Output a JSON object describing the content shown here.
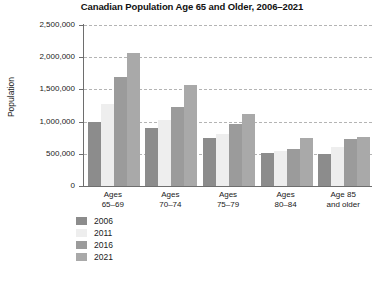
{
  "chart_data": {
    "type": "bar",
    "title": "Canadian Population Age 65 and Older, 2006–2021",
    "xlabel": "",
    "ylabel": "Population",
    "ylim": [
      0,
      2500000
    ],
    "ytick_labels": [
      "2,500,000",
      "2,000,000",
      "1,500,000",
      "1,000,000",
      "500,000",
      "0"
    ],
    "ytick_values": [
      2500000,
      2000000,
      1500000,
      1000000,
      500000,
      0
    ],
    "grid": true,
    "legend_position": "bottom-left",
    "categories": [
      "Ages 65–69",
      "Ages 70–74",
      "Ages 75–79",
      "Ages 80–84",
      "Age 85 and older"
    ],
    "category_lines": [
      [
        "Ages",
        "65–69"
      ],
      [
        "Ages",
        "70–74"
      ],
      [
        "Ages",
        "75–79"
      ],
      [
        "Ages",
        "80–84"
      ],
      [
        "Age 85",
        "and older"
      ]
    ],
    "series": [
      {
        "name": "2006",
        "color": "#8c8c8c",
        "values": [
          1000000,
          900000,
          750000,
          510000,
          500000
        ]
      },
      {
        "name": "2011",
        "color": "#eeeeee",
        "values": [
          1270000,
          1020000,
          800000,
          545000,
          600000
        ]
      },
      {
        "name": "2016",
        "color": "#9b9b9b",
        "values": [
          1700000,
          1230000,
          960000,
          575000,
          730000
        ]
      },
      {
        "name": "2021",
        "color": "#a9a9a9",
        "values": [
          2060000,
          1570000,
          1120000,
          745000,
          760000
        ]
      }
    ]
  }
}
